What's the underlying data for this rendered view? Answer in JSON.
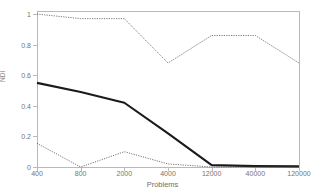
{
  "chart_data": {
    "type": "line",
    "title": "",
    "xlabel": "Problems",
    "ylabel": "NDI",
    "categories": [
      "400",
      "800",
      "2000",
      "4000",
      "12000",
      "40000",
      "120000"
    ],
    "x_tick_labels": [
      "400",
      "800",
      "2000",
      "4000",
      "12000",
      "40000",
      "120000"
    ],
    "y_tick_labels": [
      "0",
      "0.2",
      "0.4",
      "0.6",
      "0.8",
      "1"
    ],
    "y_tick_values": [
      0,
      0.2,
      0.4,
      0.6,
      0.8,
      1
    ],
    "ylim": [
      0,
      1.02
    ],
    "grid": false,
    "legend": "none",
    "series": [
      {
        "name": "upper-bound",
        "style": "dotted-thin",
        "color": "#555555",
        "values": [
          1.0,
          0.97,
          0.97,
          0.68,
          0.86,
          0.86,
          0.68
        ]
      },
      {
        "name": "mean",
        "style": "solid-thick",
        "color": "#1a1a1a",
        "values": [
          0.55,
          0.49,
          0.42,
          0.22,
          0.012,
          0.006,
          0.004
        ]
      },
      {
        "name": "lower-bound",
        "style": "dotted-thin",
        "color": "#555555",
        "values": [
          0.155,
          0.0,
          0.1,
          0.02,
          0.0,
          0.0,
          0.0
        ]
      }
    ]
  },
  "axes": {
    "y_title": "NDI",
    "x_title": "Problems"
  }
}
